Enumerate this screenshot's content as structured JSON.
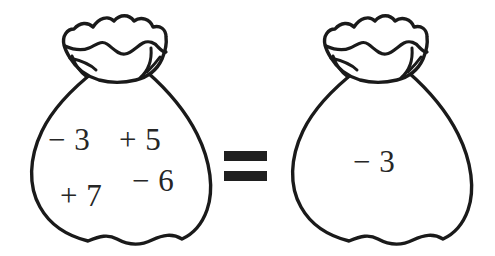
{
  "figure": {
    "type": "integer-bag-equation",
    "ink_color": "#1a1a1a",
    "text_color": "#262626",
    "background_color": "#ffffff"
  },
  "left_bag": {
    "name": "left-money-bag",
    "terms": [
      {
        "id": "neg3",
        "text": "− 3"
      },
      {
        "id": "pos5",
        "text": "+ 5"
      },
      {
        "id": "pos7",
        "text": "+ 7"
      },
      {
        "id": "neg6",
        "text": "− 6"
      }
    ],
    "line1": "− 3  + 5",
    "line2": "+ 7  − 6"
  },
  "operator": {
    "name": "equals-sign",
    "symbol": "="
  },
  "right_bag": {
    "name": "right-money-bag",
    "terms": [
      {
        "id": "neg3",
        "text": "− 3"
      }
    ],
    "line1": "− 3"
  }
}
